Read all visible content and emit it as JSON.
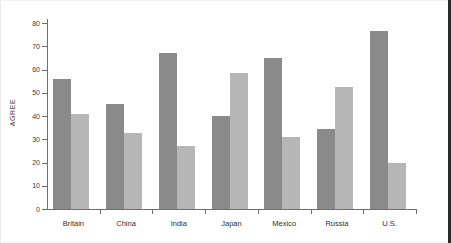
{
  "chart_data": {
    "type": "bar",
    "title": "",
    "xlabel": "",
    "ylabel": "AGREE",
    "ylim": [
      0,
      80
    ],
    "yticks": [
      0,
      10,
      20,
      30,
      40,
      50,
      60,
      70,
      80
    ],
    "ytick_labels": [
      "0",
      "10",
      "20",
      "30",
      "40",
      "50",
      "60",
      "70",
      "80"
    ],
    "grid": false,
    "legend": "none",
    "categories": [
      "Britain",
      "China",
      "India",
      "Japan",
      "Mexico",
      "Russia",
      "U.S."
    ],
    "series": [
      {
        "name": "series-dark",
        "color": "#8a8a8a",
        "values": [
          56,
          45,
          67,
          40,
          65,
          34.5,
          76.5
        ]
      },
      {
        "name": "series-light",
        "color": "#b6b6b6",
        "values": [
          41,
          32.5,
          27,
          58.5,
          31,
          52.5,
          20
        ]
      }
    ]
  },
  "axis": {
    "y_label": "AGREE"
  }
}
